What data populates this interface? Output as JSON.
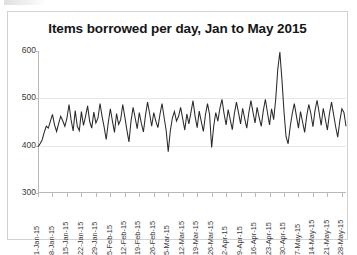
{
  "chart_data": {
    "type": "line",
    "title": "Items borrowed per day, Jan to May 2015",
    "xlabel": "",
    "ylabel": "",
    "ylim": [
      300,
      600
    ],
    "yticks": [
      300,
      400,
      500,
      600
    ],
    "ytick_labels": [
      "300",
      "400",
      "500",
      "600"
    ],
    "grid": true,
    "grid_axis": "y",
    "legend": false,
    "legend_position": "none",
    "line_color": "#2a2a2a",
    "x_tick_interval_days": 7,
    "x_tick_labels": [
      "1-Jan-15",
      "8-Jan-15",
      "15-Jan-15",
      "22-Jan-15",
      "29-Jan-15",
      "5-Feb-15",
      "12-Feb-15",
      "19-Feb-15",
      "26-Feb-15",
      "5-Mar-15",
      "12-Mar-15",
      "19-Mar-15",
      "26-Mar-15",
      "2-Apr-15",
      "9-Apr-15",
      "16-Apr-15",
      "23-Apr-15",
      "30-Apr-15",
      "7-May-15",
      "14-May-15",
      "21-May-15",
      "28-May-15"
    ],
    "x_start": "1-Jan-15",
    "x_end": "31-May-15",
    "values": [
      398,
      404,
      412,
      428,
      441,
      437,
      452,
      466,
      444,
      430,
      447,
      462,
      452,
      441,
      458,
      487,
      455,
      431,
      474,
      441,
      432,
      472,
      443,
      462,
      484,
      451,
      437,
      471,
      448,
      458,
      489,
      462,
      439,
      413,
      449,
      478,
      452,
      428,
      468,
      445,
      455,
      487,
      461,
      433,
      408,
      452,
      481,
      459,
      436,
      470,
      447,
      429,
      464,
      492,
      468,
      441,
      470,
      452,
      438,
      466,
      489,
      460,
      432,
      387,
      431,
      458,
      472,
      452,
      462,
      481,
      457,
      433,
      467,
      446,
      471,
      495,
      462,
      438,
      473,
      451,
      430,
      465,
      489,
      466,
      396,
      441,
      470,
      452,
      479,
      498,
      468,
      444,
      476,
      455,
      434,
      468,
      492,
      470,
      446,
      479,
      457,
      437,
      470,
      495,
      471,
      448,
      481,
      459,
      441,
      474,
      498,
      470,
      444,
      478,
      455,
      498,
      562,
      598,
      540,
      472,
      419,
      404,
      440,
      468,
      489,
      463,
      437,
      472,
      450,
      428,
      463,
      487,
      468,
      440,
      474,
      496,
      470,
      443,
      479,
      456,
      433,
      468,
      492,
      466,
      440,
      418,
      452,
      478,
      470,
      441
    ]
  }
}
